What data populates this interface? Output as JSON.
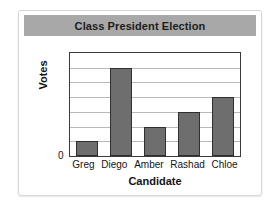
{
  "chart_data": {
    "type": "bar",
    "title": "Class President Election",
    "xlabel": "Candidate",
    "ylabel": "Votes",
    "categories": [
      "Greg",
      "Diego",
      "Amber",
      "Rashad",
      "Chloe"
    ],
    "values": [
      1,
      6,
      2,
      3,
      4
    ],
    "ylim": [
      0,
      7
    ],
    "ytick_labels": [
      "0"
    ],
    "gridlines": 6,
    "grid": true,
    "legend": "none",
    "colors": {
      "bar_fill": "#6e6e6e",
      "bar_border": "#2f2f2f",
      "title_band": "#a8a8a8",
      "gridline": "#b9b9b9",
      "axis": "#3a3a3a",
      "text": "#141414",
      "card_border": "#d8d8d8",
      "background": "#ffffff"
    }
  }
}
